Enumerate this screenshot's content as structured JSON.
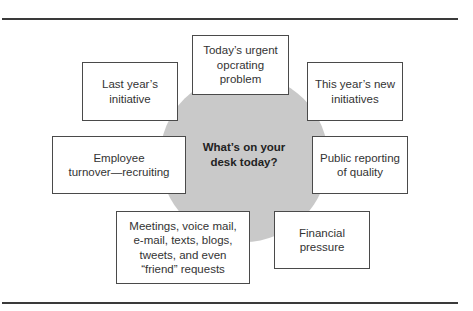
{
  "diagram": {
    "center": {
      "label": "What’s on your\ndesk today?",
      "fill": "#c9c9c9"
    },
    "nodes": [
      {
        "id": "urgent",
        "label": "Today’s urgent\nopcrating\nproblem"
      },
      {
        "id": "last-year",
        "label": "Last year’s\ninitiative"
      },
      {
        "id": "new-initiatives",
        "label": "This year’s new\ninitiatives"
      },
      {
        "id": "turnover",
        "label": "Employee\nturnover—recruiting"
      },
      {
        "id": "public-reporting",
        "label": "Public reporting\nof quality"
      },
      {
        "id": "communications",
        "label": "Meetings, voice mail,\ne-mail, texts, blogs,\ntweets, and even\n“friend” requests"
      },
      {
        "id": "financial",
        "label": "Financial\npressure"
      }
    ]
  }
}
